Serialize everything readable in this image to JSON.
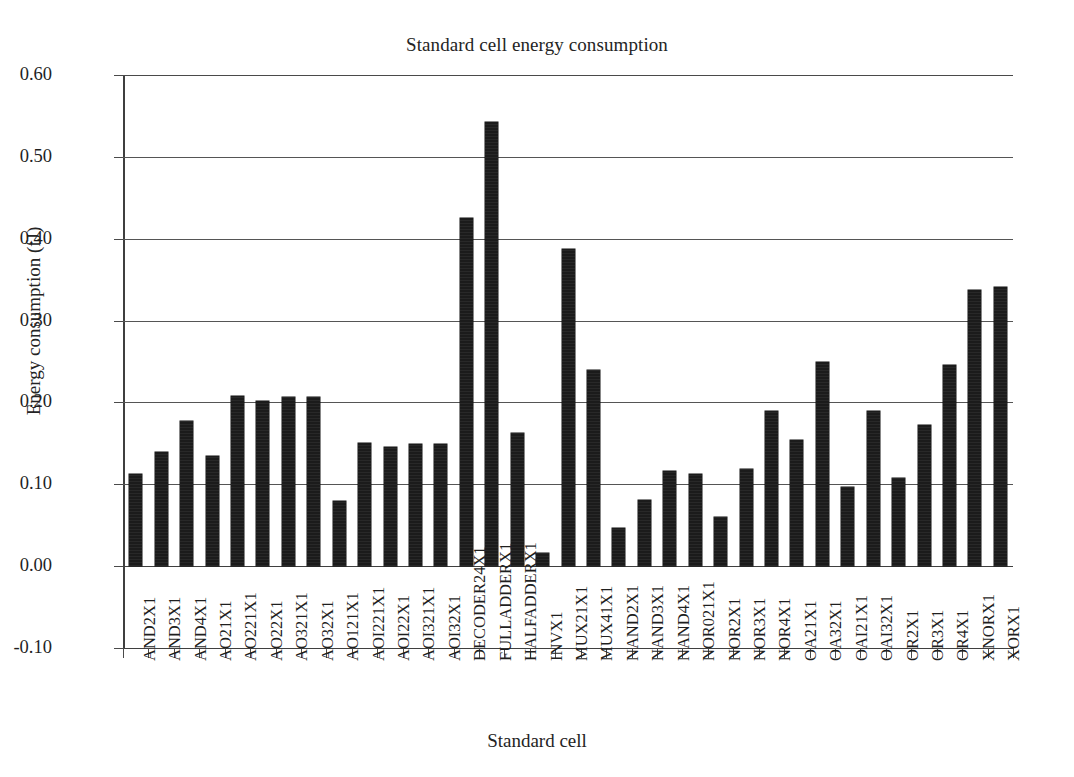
{
  "chart_data": {
    "type": "bar",
    "title": "Standard cell energy consumption",
    "xlabel": "Standard cell",
    "ylabel": "Energy consumption (fJ)",
    "ylim": [
      -0.1,
      0.6
    ],
    "ytick_labels": [
      "0.60",
      "0.50",
      "0.40",
      "0.30",
      "0.20",
      "0.10",
      "0.00",
      "-0.10"
    ],
    "ytick_values": [
      0.6,
      0.5,
      0.4,
      0.3,
      0.2,
      0.1,
      0.0,
      -0.1
    ],
    "grid": true,
    "legend": false,
    "bar_color": "#1b1b1b",
    "categories": [
      "AND2X1",
      "AND3X1",
      "AND4X1",
      "AO21X1",
      "AO221X1",
      "AO22X1",
      "AO321X1",
      "AO32X1",
      "AO121X1",
      "AOI221X1",
      "AOI22X1",
      "AOI321X1",
      "AOI32X1",
      "DECODER24X1",
      "FULLADDERX1",
      "HALFADDERX1",
      "INVX1",
      "MUX21X1",
      "MUX41X1",
      "NAND2X1",
      "NAND3X1",
      "NAND4X1",
      "NOR021X1",
      "NOR2X1",
      "NOR3X1",
      "NOR4X1",
      "OA21X1",
      "OA32X1",
      "OAI21X1",
      "OAI32X1",
      "OR2X1",
      "OR3X1",
      "OR4X1",
      "XNORX1",
      "XORX1"
    ],
    "values": [
      0.112,
      0.139,
      0.177,
      0.135,
      0.208,
      0.202,
      0.207,
      0.207,
      0.079,
      0.15,
      0.146,
      0.149,
      0.149,
      0.425,
      0.543,
      0.163,
      0.016,
      0.388,
      0.24,
      0.047,
      0.081,
      0.116,
      0.112,
      0.06,
      0.119,
      0.19,
      0.154,
      0.249,
      0.097,
      0.19,
      0.108,
      0.172,
      0.246,
      0.337,
      0.341
    ],
    "units": "fJ"
  }
}
